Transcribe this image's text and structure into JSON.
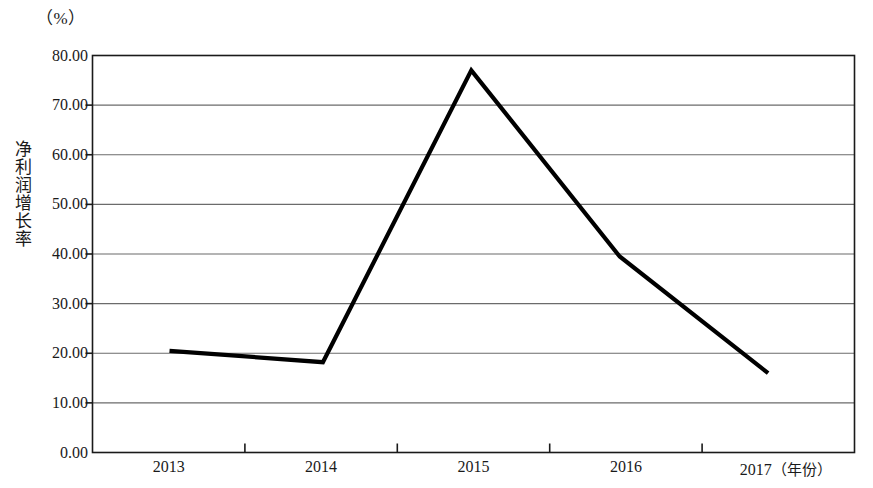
{
  "chart_data": {
    "type": "line",
    "title": "",
    "subtitle": "",
    "xlabel": "（年份）",
    "ylabel": "净利润增长率",
    "unit_label": "（%）",
    "categories": [
      "2013",
      "2014",
      "2015",
      "2016",
      "2017"
    ],
    "series": [
      {
        "name": "净利润增长率",
        "values": [
          20.5,
          18.2,
          77.0,
          39.5,
          16.0
        ],
        "color": "#000000"
      }
    ],
    "x_tick_labels": [
      "2013",
      "2014",
      "2015",
      "2016",
      "2017"
    ],
    "y_tick_labels": [
      "0.00",
      "10.00",
      "20.00",
      "30.00",
      "40.00",
      "50.00",
      "60.00",
      "70.00",
      "80.00"
    ],
    "y_tick_values": [
      0,
      10,
      20,
      30,
      40,
      50,
      60,
      70,
      80
    ],
    "ylim": [
      0,
      80
    ],
    "grid": true,
    "grid_axis": "y",
    "legend": false,
    "legend_position": "none",
    "frame": true,
    "colors": {
      "line": "#1a1a1a",
      "grid": "#6b6b6b",
      "frame": "#1a1a1a",
      "text": "#1a1a1a",
      "background": "#ffffff"
    }
  }
}
